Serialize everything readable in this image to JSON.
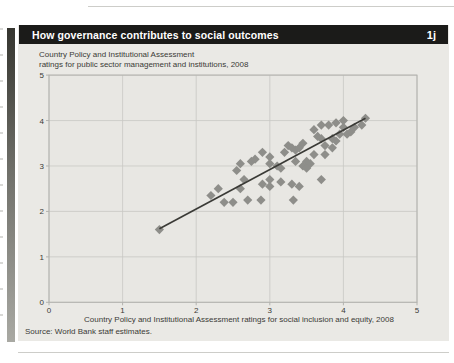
{
  "header": {
    "title": "How governance contributes to social outcomes",
    "figure_number": "1j"
  },
  "subtitle_line1": "Country Policy and Institutional Assessment",
  "subtitle_line2": "ratings for public sector management and institutions, 2008",
  "xaxis_label": "Country Policy and Institutional Assessment ratings for social inclusion and equity, 2008",
  "source": "Source: World Bank staff estimates.",
  "colors": {
    "panel_bg": "#eae9e5",
    "header_bg": "#1b1b19",
    "grid": "#c8c8c4",
    "frame": "#b2b2ae",
    "marker": "#8e8e8a",
    "trend": "#3a3a36",
    "text": "#3a3a36"
  },
  "chart_data": {
    "type": "scatter",
    "title": "How governance contributes to social outcomes",
    "subtitle": "Country Policy and Institutional Assessment ratings for public sector management and institutions, 2008",
    "xlabel": "Country Policy and Institutional Assessment ratings for social inclusion and equity, 2008",
    "ylabel": "Country Policy and Institutional Assessment ratings for public sector management and institutions, 2008",
    "xlim": [
      0,
      5
    ],
    "ylim": [
      0,
      5
    ],
    "xticks": [
      0,
      1,
      2,
      3,
      4,
      5
    ],
    "yticks": [
      0,
      1,
      2,
      3,
      4,
      5
    ],
    "grid": true,
    "legend": "none",
    "marker": "diamond",
    "trend_line": {
      "x1": 1.5,
      "y1": 1.62,
      "x2": 4.3,
      "y2": 4.05
    },
    "points": [
      [
        1.5,
        1.6
      ],
      [
        2.2,
        2.35
      ],
      [
        2.3,
        2.5
      ],
      [
        2.38,
        2.2
      ],
      [
        2.5,
        2.2
      ],
      [
        2.55,
        2.9
      ],
      [
        2.6,
        3.05
      ],
      [
        2.6,
        2.5
      ],
      [
        2.65,
        2.7
      ],
      [
        2.7,
        2.25
      ],
      [
        2.75,
        3.1
      ],
      [
        2.8,
        3.15
      ],
      [
        2.88,
        2.25
      ],
      [
        2.9,
        2.6
      ],
      [
        2.9,
        3.3
      ],
      [
        3.0,
        3.05
      ],
      [
        3.0,
        2.7
      ],
      [
        3.0,
        2.55
      ],
      [
        3.0,
        3.2
      ],
      [
        3.1,
        3.0
      ],
      [
        3.15,
        2.95
      ],
      [
        3.15,
        2.65
      ],
      [
        3.2,
        3.3
      ],
      [
        3.25,
        3.45
      ],
      [
        3.3,
        2.6
      ],
      [
        3.32,
        2.25
      ],
      [
        3.3,
        3.4
      ],
      [
        3.35,
        3.35
      ],
      [
        3.35,
        3.1
      ],
      [
        3.4,
        3.4
      ],
      [
        3.4,
        2.55
      ],
      [
        3.45,
        3.5
      ],
      [
        3.45,
        3.0
      ],
      [
        3.5,
        3.1
      ],
      [
        3.55,
        3.05
      ],
      [
        3.5,
        2.95
      ],
      [
        3.6,
        3.8
      ],
      [
        3.6,
        3.25
      ],
      [
        3.65,
        3.65
      ],
      [
        3.7,
        3.9
      ],
      [
        3.7,
        3.6
      ],
      [
        3.7,
        2.7
      ],
      [
        3.75,
        3.45
      ],
      [
        3.75,
        3.25
      ],
      [
        3.8,
        3.9
      ],
      [
        3.85,
        3.6
      ],
      [
        3.85,
        3.4
      ],
      [
        3.9,
        3.95
      ],
      [
        3.9,
        3.55
      ],
      [
        3.95,
        3.7
      ],
      [
        4.0,
        4.0
      ],
      [
        4.0,
        3.85
      ],
      [
        4.05,
        3.7
      ],
      [
        4.1,
        3.75
      ],
      [
        4.15,
        3.85
      ],
      [
        4.25,
        3.9
      ],
      [
        4.3,
        4.05
      ]
    ]
  }
}
